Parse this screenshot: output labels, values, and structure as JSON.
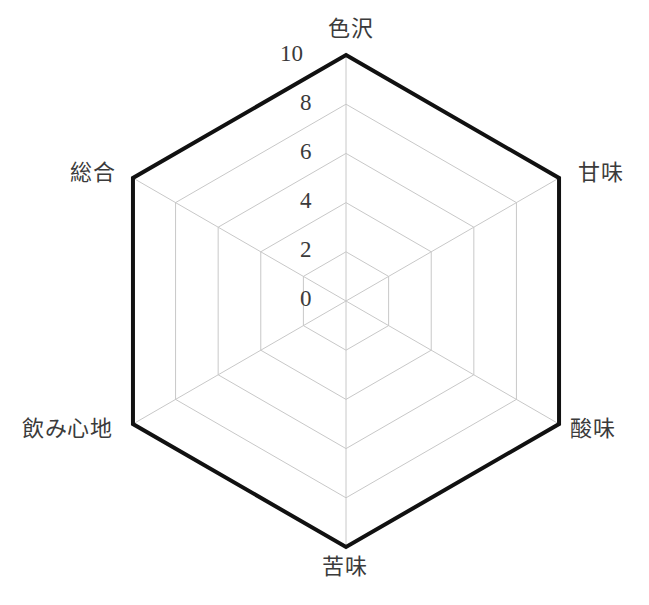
{
  "chart_data": {
    "type": "radar",
    "title": "",
    "subtitle": "",
    "xlabel": "",
    "ylabel": "",
    "grid": true,
    "legend": "none",
    "shape": "hexagon",
    "rlim": [
      0,
      10
    ],
    "r_ticks": [
      0,
      2,
      4,
      6,
      8,
      10
    ],
    "r_tick_labels": [
      "0",
      "2",
      "4",
      "6",
      "8",
      "10"
    ],
    "categories": [
      "色沢",
      "甘味",
      "酸味",
      "苦味",
      "飲み心地",
      "総合"
    ],
    "category_labels_romaji": [
      "shikitaku",
      "kanmi",
      "sanmi",
      "nigami",
      "nomigokochi",
      "sougou"
    ],
    "series": [
      {
        "name": "",
        "values": [
          10,
          10,
          10,
          10,
          10,
          10
        ],
        "line_color": "#111111",
        "line_width": 4,
        "fill": "none"
      }
    ],
    "colors": {
      "grid_line": "#c8c8c8",
      "spoke_line": "#c8c8c8",
      "data_line": "#111111",
      "text": "#3a3a3a",
      "background": "#ffffff"
    }
  },
  "geometry": {
    "center_x": 346,
    "center_y": 301,
    "radius": 246,
    "start_angle_deg": -90,
    "tick_label_offset_x": -22,
    "tick_label_offset_y": -4
  },
  "axis_labels": [
    {
      "text": "色沢",
      "left": 328,
      "top": 18,
      "align": "center"
    },
    {
      "text": "甘味",
      "left": 578,
      "top": 162,
      "align": "left"
    },
    {
      "text": "酸味",
      "left": 570,
      "top": 418,
      "align": "left"
    },
    {
      "text": "苦味",
      "left": 322,
      "top": 556,
      "align": "center"
    },
    {
      "text": "飲み心地",
      "left": 22,
      "top": 418,
      "align": "left"
    },
    {
      "text": "総合",
      "left": 70,
      "top": 162,
      "align": "left"
    }
  ],
  "tick_labels": [
    {
      "text": "10",
      "left": 280,
      "top": 42
    },
    {
      "text": "8",
      "left": 300,
      "top": 91
    },
    {
      "text": "6",
      "left": 300,
      "top": 140
    },
    {
      "text": "4",
      "left": 300,
      "top": 189
    },
    {
      "text": "2",
      "left": 300,
      "top": 238
    },
    {
      "text": "0",
      "left": 300,
      "top": 287
    }
  ]
}
